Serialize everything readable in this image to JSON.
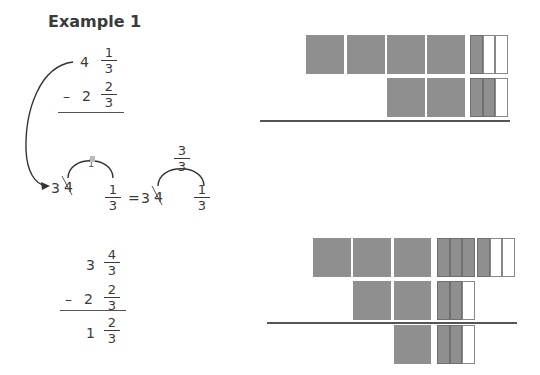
{
  "title": "Example 1",
  "problem": {
    "minuend": {
      "whole": "4",
      "num": "1",
      "den": "3"
    },
    "operator": "–",
    "subtrahend": {
      "whole": "2",
      "num": "2",
      "den": "3"
    }
  },
  "regroup": {
    "prefix_whole": "3",
    "crossed_whole": "4",
    "borrowed_mid_left": "1",
    "frac_left": {
      "num": "1",
      "den": "3"
    },
    "equals": "=",
    "prefix_whole_right": "3",
    "crossed_whole_right": "4",
    "borrowed_mid_right": {
      "num": "3",
      "den": "3"
    },
    "frac_right": {
      "num": "1",
      "den": "3"
    }
  },
  "solution": {
    "minuend": {
      "whole": "3",
      "num": "4",
      "den": "3"
    },
    "operator": "–",
    "subtrahend": {
      "whole": "2",
      "num": "2",
      "den": "3"
    },
    "result": {
      "whole": "1",
      "num": "2",
      "den": "3"
    }
  },
  "models": {
    "top": {
      "row1": {
        "whole_blocks": 4,
        "thirds_shaded": 1,
        "thirds_total": 3
      },
      "row2": {
        "whole_blocks": 2,
        "thirds_shaded": 2,
        "thirds_total": 3
      }
    },
    "bottom": {
      "row1": {
        "whole_blocks": 3,
        "regrouped_thirds_shaded": 3,
        "thirds_shaded": 1,
        "thirds_total": 3
      },
      "row2": {
        "whole_blocks": 2,
        "thirds_shaded": 2,
        "thirds_total": 3
      },
      "row3": {
        "whole_blocks": 1,
        "thirds_shaded": 2,
        "thirds_total": 3
      }
    },
    "colors": {
      "shaded": "#8f8f8f",
      "empty": "#ffffff",
      "line": "#555555"
    }
  }
}
